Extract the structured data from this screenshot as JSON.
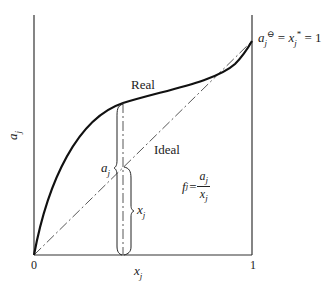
{
  "diagram": {
    "title": "",
    "axes": {
      "x_label_var": "x",
      "x_label_sub": "j",
      "y_label_var": "a",
      "y_label_sub": "j",
      "x_tick_0": "0",
      "x_tick_1": "1"
    },
    "curves": {
      "real_label": "Real",
      "ideal_label": "Ideal"
    },
    "annotations": {
      "endpoint_a": "a",
      "endpoint_a_sub": "j",
      "endpoint_a_sup": "⊖",
      "endpoint_eq1": " = ",
      "endpoint_x": "x",
      "endpoint_x_sub": "j",
      "endpoint_x_sup": "*",
      "endpoint_eq2": " = 1",
      "bracket_a": "a",
      "bracket_a_sub": "j",
      "bracket_x": "x",
      "bracket_x_sub": "j",
      "formula_f": "f",
      "formula_f_sub": "j",
      "formula_eq": "=",
      "formula_num": "a",
      "formula_num_sub": "j",
      "formula_den": "x",
      "formula_den_sub": "j"
    },
    "colors": {
      "real_curve": "#111111",
      "ideal_line": "#444444",
      "axes": "#333333"
    }
  }
}
